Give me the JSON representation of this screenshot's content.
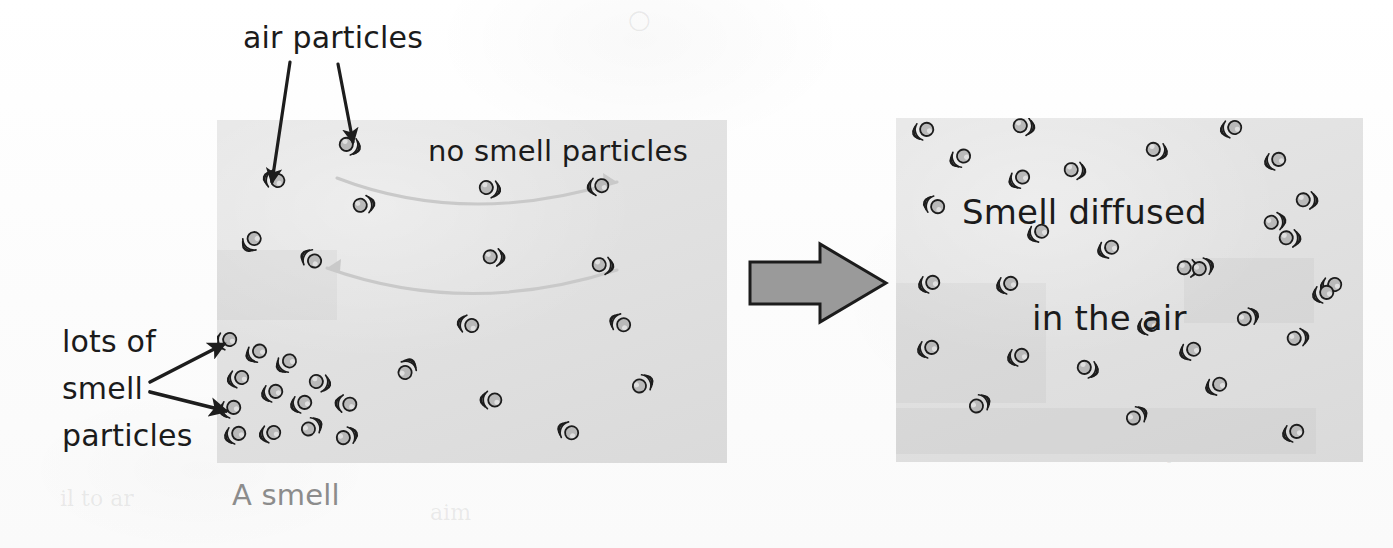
{
  "diagram": {
    "colors": {
      "page_background": "#fdfdfd",
      "panel_background": "#e2e2e2",
      "particle_fill": "#b9b9b9",
      "particle_outline": "#1c1c1c",
      "label_text": "#1b1b1b",
      "caption_text": "#8c8c8c",
      "block_arrow_fill": "#9a9a9a",
      "block_arrow_outline": "#1c1c1c",
      "pointer_arrow": "#1d1d1d",
      "diffusion_arrow": "#c4c4c4"
    },
    "labels": {
      "air_particles": "air particles",
      "no_smell_particles": "no smell particles",
      "lots_of": "lots of",
      "smell": "smell",
      "particles": "particles",
      "smell_diffused": "Smell diffused",
      "in_the_air": "in the air",
      "a_smell": "A smell"
    },
    "panels": [
      {
        "id": "left",
        "name": "before-diffusion-panel",
        "x": 217,
        "y": 120,
        "width": 510,
        "height": 343,
        "caption": "A smell",
        "description": "Smell particles concentrated in the lower-left corner; rest of the box has only air particles",
        "particle_count": 42
      },
      {
        "id": "right",
        "name": "after-diffusion-panel",
        "x": 896,
        "y": 118,
        "width": 467,
        "height": 344,
        "description": "Smell particles spread evenly throughout the box",
        "particle_count": 37
      }
    ],
    "pointer_arrows": [
      {
        "name": "arrow-air-particles-1",
        "x1": 290,
        "y1": 62,
        "x2": 272,
        "y2": 182,
        "label": "air particles"
      },
      {
        "name": "arrow-air-particles-2",
        "x1": 338,
        "y1": 64,
        "x2": 352,
        "y2": 142,
        "label": "air particles"
      },
      {
        "name": "arrow-smell-particles-1",
        "x1": 152,
        "y1": 382,
        "x2": 226,
        "y2": 344,
        "label": "lots of smell particles"
      },
      {
        "name": "arrow-smell-particles-2",
        "x1": 152,
        "y1": 392,
        "x2": 227,
        "y2": 410,
        "label": "lots of smell particles"
      }
    ],
    "block_arrow": {
      "name": "transition-arrow",
      "x": 748,
      "y": 244,
      "width": 138,
      "height": 78,
      "direction": "right",
      "meaning": "smell diffuses over time"
    },
    "diffusion_arcs": [
      {
        "name": "diffusion-arc-top",
        "direction": "right",
        "y": 188
      },
      {
        "name": "diffusion-arc-bottom",
        "direction": "left",
        "y": 268
      }
    ],
    "particles_left": [
      {
        "x": 276,
        "y": 180,
        "rot": 195
      },
      {
        "x": 348,
        "y": 145,
        "rot": 20
      },
      {
        "x": 253,
        "y": 240,
        "rot": 130
      },
      {
        "x": 362,
        "y": 205,
        "rot": 350
      },
      {
        "x": 313,
        "y": 260,
        "rot": 210
      },
      {
        "x": 406,
        "y": 371,
        "rot": 300
      },
      {
        "x": 488,
        "y": 188,
        "rot": 15
      },
      {
        "x": 600,
        "y": 186,
        "rot": 170
      },
      {
        "x": 492,
        "y": 257,
        "rot": 5
      },
      {
        "x": 601,
        "y": 265,
        "rot": 10
      },
      {
        "x": 470,
        "y": 325,
        "rot": 195
      },
      {
        "x": 622,
        "y": 324,
        "rot": 205
      },
      {
        "x": 493,
        "y": 400,
        "rot": 180
      },
      {
        "x": 641,
        "y": 385,
        "rot": 330
      },
      {
        "x": 570,
        "y": 432,
        "rot": 205
      },
      {
        "x": 228,
        "y": 340,
        "rot": 165
      },
      {
        "x": 258,
        "y": 352,
        "rot": 150
      },
      {
        "x": 288,
        "y": 362,
        "rot": 145
      },
      {
        "x": 240,
        "y": 378,
        "rot": 165
      },
      {
        "x": 274,
        "y": 392,
        "rot": 160
      },
      {
        "x": 318,
        "y": 382,
        "rot": 15
      },
      {
        "x": 232,
        "y": 408,
        "rot": 160
      },
      {
        "x": 303,
        "y": 403,
        "rot": 160
      },
      {
        "x": 348,
        "y": 404,
        "rot": 185
      },
      {
        "x": 237,
        "y": 434,
        "rot": 160
      },
      {
        "x": 272,
        "y": 433,
        "rot": 165
      },
      {
        "x": 310,
        "y": 428,
        "rot": 330
      },
      {
        "x": 345,
        "y": 437,
        "rot": 340
      }
    ],
    "particles_right": [
      {
        "x": 925,
        "y": 130,
        "rot": 160
      },
      {
        "x": 1022,
        "y": 126,
        "rot": 10
      },
      {
        "x": 1155,
        "y": 150,
        "rot": 20
      },
      {
        "x": 1233,
        "y": 128,
        "rot": 165
      },
      {
        "x": 1277,
        "y": 160,
        "rot": 160
      },
      {
        "x": 962,
        "y": 157,
        "rot": 150
      },
      {
        "x": 1073,
        "y": 170,
        "rot": 10
      },
      {
        "x": 1021,
        "y": 178,
        "rot": 150
      },
      {
        "x": 1305,
        "y": 200,
        "rot": 5
      },
      {
        "x": 936,
        "y": 206,
        "rot": 200
      },
      {
        "x": 1040,
        "y": 232,
        "rot": 155
      },
      {
        "x": 1273,
        "y": 222,
        "rot": 350
      },
      {
        "x": 1288,
        "y": 238,
        "rot": 5
      },
      {
        "x": 1110,
        "y": 248,
        "rot": 155
      },
      {
        "x": 1186,
        "y": 268,
        "rot": 5
      },
      {
        "x": 931,
        "y": 283,
        "rot": 160
      },
      {
        "x": 1009,
        "y": 284,
        "rot": 160
      },
      {
        "x": 1333,
        "y": 285,
        "rot": 165
      },
      {
        "x": 1201,
        "y": 268,
        "rot": 340
      },
      {
        "x": 1150,
        "y": 325,
        "rot": 160
      },
      {
        "x": 1246,
        "y": 318,
        "rot": 340
      },
      {
        "x": 930,
        "y": 348,
        "rot": 160
      },
      {
        "x": 1020,
        "y": 356,
        "rot": 160
      },
      {
        "x": 1086,
        "y": 368,
        "rot": 20
      },
      {
        "x": 1192,
        "y": 350,
        "rot": 155
      },
      {
        "x": 1296,
        "y": 338,
        "rot": 350
      },
      {
        "x": 1325,
        "y": 293,
        "rot": 160
      },
      {
        "x": 978,
        "y": 405,
        "rot": 330
      },
      {
        "x": 1135,
        "y": 417,
        "rot": 330
      },
      {
        "x": 1295,
        "y": 432,
        "rot": 160
      },
      {
        "x": 1218,
        "y": 385,
        "rot": 155
      }
    ]
  }
}
